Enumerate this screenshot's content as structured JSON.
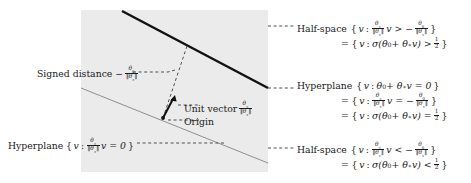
{
  "figure": {
    "kind": "geometric-diagram",
    "colors": {
      "background": "#ffffff",
      "shaded_region": "#ebebeb",
      "thick_hyperplane_line": "#111111",
      "thin_hyperplane_line": "#8c8c8c",
      "dashed_leader": "#4d4d4d",
      "vector_arrow": "#111111",
      "text": "#1a1a1a"
    },
    "geometry": {
      "panel": {
        "x": 81,
        "y": 10,
        "width": 187,
        "height": 162
      },
      "thick_line": {
        "x1": 122,
        "y1": 11,
        "x2": 268,
        "y2": 88
      },
      "thin_line": {
        "x1": 81,
        "y1": 88,
        "x2": 268,
        "y2": 163
      },
      "origin_point": {
        "x": 163,
        "y": 118
      },
      "unit_vector_tip": {
        "x": 175,
        "y": 96
      },
      "perpendicular_foot": {
        "x": 187,
        "y": 46
      }
    }
  },
  "labels": {
    "signed_distance": {
      "text": "Signed distance",
      "value_sign": "−",
      "fraction_num": "θ",
      "fraction_num_sub": "0",
      "fraction_den_open": "‖θ",
      "fraction_den_sub": "∗",
      "fraction_den_close": "‖"
    },
    "unit_vector": {
      "text": "Unit vector",
      "fraction_num": "θ",
      "fraction_num_sub": "∗",
      "fraction_den_open": "‖θ",
      "fraction_den_sub": "∗",
      "fraction_den_close": "‖"
    },
    "origin": {
      "text": "Origin"
    },
    "hyperplane_left": {
      "tag": "Hyperplane",
      "open": "{",
      "var": "v",
      "colon": ":",
      "fraction_num": "θ",
      "fraction_num_sub": "∗",
      "fraction_den_open": "‖θ",
      "fraction_den_sub": "∗",
      "fraction_den_close": "‖",
      "rest": "v = 0",
      "close": "}"
    },
    "halfspace_top": {
      "tag": "Half-space",
      "line1": {
        "open": "{",
        "var": "v",
        "colon": ":",
        "fraction_num": "θ",
        "fraction_num_sub": "∗",
        "fraction_den_open": "‖θ",
        "fraction_den_sub": "∗",
        "fraction_den_close": "‖",
        "mid": "v > −",
        "frac2_num": "θ",
        "frac2_num_sub": "0",
        "frac2_den_open": "‖θ",
        "frac2_den_sub": "∗",
        "frac2_den_close": "‖",
        "close": "}"
      },
      "line2": {
        "eq": "=",
        "open": "{",
        "var": "v",
        "colon": ":",
        "expr": "σ(θ",
        "expr_sub": "0",
        "expr2": " + θ",
        "expr2_sub": "∗",
        "expr3": "v) >",
        "frac_num": "1",
        "frac_den": "2",
        "close": "}"
      }
    },
    "hyperplane_right": {
      "tag": "Hyperplane",
      "line1": {
        "open": "{",
        "var": "v",
        "colon": ":",
        "expr": "θ",
        "expr_sub": "0",
        "expr2": " + θ",
        "expr2_sub": "∗",
        "expr3": "v = 0",
        "close": "}"
      },
      "line2": {
        "eq": "=",
        "open": "{",
        "var": "v",
        "colon": ":",
        "fraction_num": "θ",
        "fraction_num_sub": "∗",
        "fraction_den_open": "‖θ",
        "fraction_den_sub": "∗",
        "fraction_den_close": "‖",
        "mid": "v = −",
        "frac2_num": "θ",
        "frac2_num_sub": "0",
        "frac2_den_open": "‖θ",
        "frac2_den_sub": "∗",
        "frac2_den_close": "‖",
        "close": "}"
      },
      "line3": {
        "eq": "=",
        "open": "{",
        "var": "v",
        "colon": ":",
        "expr": "σ(θ",
        "expr_sub": "0",
        "expr2": " + θ",
        "expr2_sub": "∗",
        "expr3": "v) =",
        "frac_num": "1",
        "frac_den": "2",
        "close": "}"
      }
    },
    "halfspace_bottom": {
      "tag": "Half-space",
      "line1": {
        "open": "{",
        "var": "v",
        "colon": ":",
        "fraction_num": "θ",
        "fraction_num_sub": "∗",
        "fraction_den_open": "‖θ",
        "fraction_den_sub": "∗",
        "fraction_den_close": "‖",
        "mid": "v < −",
        "frac2_num": "θ",
        "frac2_num_sub": "0",
        "frac2_den_open": "‖θ",
        "frac2_den_sub": "∗",
        "frac2_den_close": "‖",
        "close": "}"
      },
      "line2": {
        "eq": "=",
        "open": "{",
        "var": "v",
        "colon": ":",
        "expr": "σ(θ",
        "expr_sub": "0",
        "expr2": " + θ",
        "expr2_sub": "∗",
        "expr3": "v) <",
        "frac_num": "1",
        "frac_den": "2",
        "close": "}"
      }
    }
  }
}
